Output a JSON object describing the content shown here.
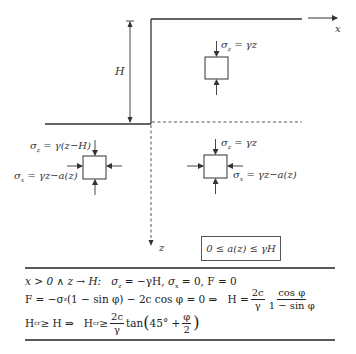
{
  "diagram": {
    "axes": {
      "x_label": "x",
      "z_label": "z"
    },
    "dimension": {
      "height_label": "H"
    },
    "elements": [
      {
        "id": "upper-right",
        "sigma_z": "σ_z = γz"
      },
      {
        "id": "lower-left",
        "sigma_z": "σ_z = γ(z−H)",
        "sigma_x": "σ_x = γz−a(z)"
      },
      {
        "id": "lower-right",
        "sigma_z": "σ_z = γz",
        "sigma_x": "σ_x = γz−a(z)"
      }
    ],
    "labels": {
      "ur_sz": "σ",
      "ur_sz_sub": "z",
      "ur_sz_rhs": " = γz",
      "ll_sz": "σ",
      "ll_sz_sub": "z",
      "ll_sz_rhs": " = γ(z−H)",
      "ll_sx": "σ",
      "ll_sx_sub": "x",
      "ll_sx_rhs": " = γz−a(z)",
      "lr_sz": "σ",
      "lr_sz_sub": "z",
      "lr_sz_rhs": " = γz",
      "lr_sx": "σ",
      "lr_sx_sub": "x",
      "lr_sx_rhs": " = γz−a(z)"
    },
    "constraint": "0 ≤ a(z) ≤ γH",
    "colors": {
      "line": "#333333",
      "background": "#ffffff"
    }
  },
  "equations": {
    "line1": "x > 0 ∧ z → H:   σz = −γH, σx = 0, F = 0",
    "line1_parts": {
      "cond": "x > 0 ∧ z → H:",
      "rest_a": "σ",
      "sub_z": "z",
      "rest_b": " = −γH, ",
      "rest_c": "σ",
      "sub_x": "x",
      "rest_d": " = 0, F = 0"
    },
    "line2_parts": {
      "lhs_a": "F = −σ",
      "sub_z": "z",
      "lhs_b": "(1 − sin φ) − 2c cos φ = 0 ⇒",
      "h": "H =",
      "f1_num": "2c",
      "f1_den": "γ",
      "f2_num": "cos φ",
      "f2_den": "1 − sin φ"
    },
    "line3_parts": {
      "a": "H",
      "sub_cr": "cr",
      "b": " ≥ H ⇒",
      "c": "H",
      "sub_cr2": "cr",
      "d": " ≥",
      "f_num": "2c",
      "f_den": "γ",
      "tan": "tan",
      "inner_a": "45° +",
      "phi_num": "φ",
      "phi_den": "2"
    }
  }
}
